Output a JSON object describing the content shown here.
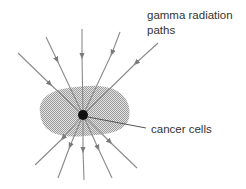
{
  "diagram": {
    "labels": {
      "radiation_line1": "gamma radiation",
      "radiation_line2": "paths",
      "target": "cancer cells"
    },
    "colors": {
      "ray": "#8a8a8a",
      "arrow": "#7a7a7a",
      "tumor_fill": "#c8c8c8",
      "dot": "#111111",
      "leader": "#555555",
      "text": "#333333"
    },
    "focus": {
      "x": 83,
      "y": 115,
      "r": 5
    },
    "rays": [
      {
        "from": [
          18,
          53
        ],
        "to": [
          137,
          168
        ]
      },
      {
        "from": [
          46,
          37
        ],
        "to": [
          112,
          178
        ]
      },
      {
        "from": [
          82,
          29
        ],
        "to": [
          84,
          180
        ]
      },
      {
        "from": [
          120,
          32
        ],
        "to": [
          58,
          178
        ]
      },
      {
        "from": [
          158,
          43
        ],
        "to": [
          35,
          165
        ]
      }
    ]
  }
}
